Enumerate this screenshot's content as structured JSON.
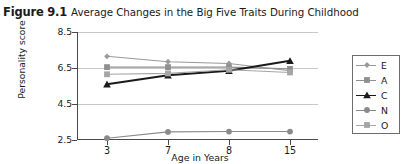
{
  "figure": {
    "number": "Figure 9.1",
    "title": "Average Changes in the Big Five Traits During Childhood"
  },
  "chart_data": {
    "type": "line",
    "title": "Average Changes in the Big Five Traits During Childhood",
    "xlabel": "Age in Years",
    "ylabel": "Personality score",
    "categories": [
      "3",
      "7",
      "8",
      "15"
    ],
    "x": [
      3,
      7,
      8,
      15
    ],
    "yticks": [
      2.5,
      4.5,
      6.5,
      8.5
    ],
    "ylim": [
      2.5,
      8.5
    ],
    "grid": "horizontal",
    "legend_position": "right",
    "series": [
      {
        "name": "E",
        "label": "E",
        "values": [
          7.15,
          6.85,
          6.75,
          6.35
        ],
        "color": "#9a9a9a",
        "marker": "diamond"
      },
      {
        "name": "A",
        "label": "A",
        "values": [
          6.55,
          6.55,
          6.55,
          6.45
        ],
        "color": "#8f8f8f",
        "marker": "square"
      },
      {
        "name": "C",
        "label": "C",
        "values": [
          5.6,
          6.1,
          6.35,
          6.9
        ],
        "color": "#1a1a1a",
        "marker": "triangle"
      },
      {
        "name": "N",
        "label": "N",
        "values": [
          2.6,
          2.95,
          2.97,
          2.97
        ],
        "color": "#8a8a8a",
        "marker": "circle"
      },
      {
        "name": "O",
        "label": "O",
        "values": [
          6.15,
          6.2,
          6.4,
          6.25
        ],
        "color": "#a5a5a5",
        "marker": "square"
      }
    ]
  },
  "legend": {
    "entries": [
      {
        "label": "E"
      },
      {
        "label": "A"
      },
      {
        "label": "C"
      },
      {
        "label": "N"
      },
      {
        "label": "O"
      }
    ]
  }
}
